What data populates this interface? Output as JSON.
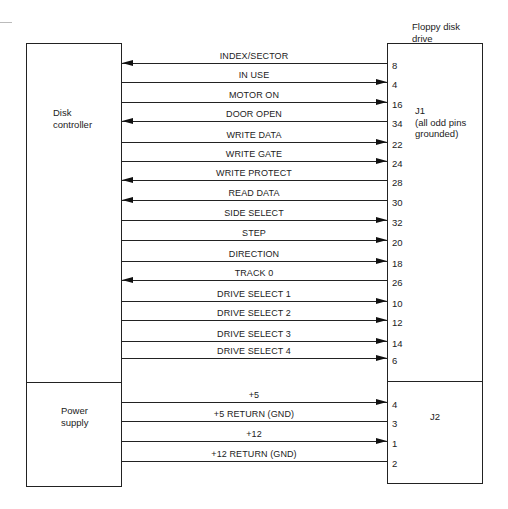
{
  "blocks": {
    "controller": {
      "label": "Disk\ncontroller"
    },
    "power_supply": {
      "label": "Power\nsupply"
    },
    "drive": {
      "label": "Floppy disk\ndrive"
    },
    "j1": {
      "label": "J1\n(all odd pins\ngrounded)"
    },
    "j2": {
      "label": "J2"
    }
  },
  "signals": [
    {
      "name": "INDEX/SECTOR",
      "pin": "8",
      "direction": "to-controller"
    },
    {
      "name": "IN USE",
      "pin": "4",
      "direction": "to-drive"
    },
    {
      "name": "MOTOR ON",
      "pin": "16",
      "direction": "to-drive"
    },
    {
      "name": "DOOR OPEN",
      "pin": "34",
      "direction": "to-controller"
    },
    {
      "name": "WRITE DATA",
      "pin": "22",
      "direction": "to-drive"
    },
    {
      "name": "WRITE GATE",
      "pin": "24",
      "direction": "to-drive"
    },
    {
      "name": "WRITE PROTECT",
      "pin": "28",
      "direction": "to-controller"
    },
    {
      "name": "READ DATA",
      "pin": "30",
      "direction": "to-controller"
    },
    {
      "name": "SIDE SELECT",
      "pin": "32",
      "direction": "to-drive"
    },
    {
      "name": "STEP",
      "pin": "20",
      "direction": "to-drive"
    },
    {
      "name": "DIRECTION",
      "pin": "18",
      "direction": "to-drive"
    },
    {
      "name": "TRACK 0",
      "pin": "26",
      "direction": "to-controller"
    },
    {
      "name": "DRIVE SELECT 1",
      "pin": "10",
      "direction": "to-drive"
    },
    {
      "name": "DRIVE SELECT 2",
      "pin": "12",
      "direction": "to-drive"
    },
    {
      "name": "DRIVE SELECT 3",
      "pin": "14",
      "direction": "to-drive"
    },
    {
      "name": "DRIVE SELECT 4",
      "pin": "6",
      "direction": "to-drive"
    }
  ],
  "power": [
    {
      "name": "+5",
      "pin": "4",
      "direction": "to-drive"
    },
    {
      "name": "+5 RETURN (GND)",
      "pin": "3",
      "direction": "none"
    },
    {
      "name": "+12",
      "pin": "1",
      "direction": "to-drive"
    },
    {
      "name": "+12 RETURN (GND)",
      "pin": "2",
      "direction": "none"
    }
  ],
  "colors": {
    "line": "#222222",
    "background": "#ffffff"
  }
}
